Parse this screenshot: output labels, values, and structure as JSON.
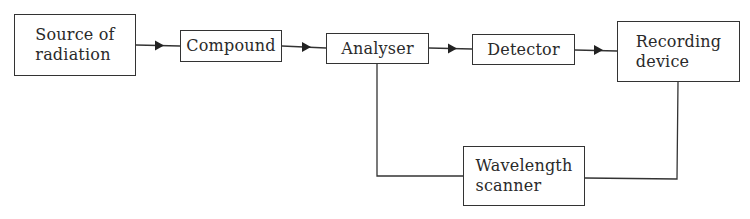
{
  "diagram": {
    "type": "block-flow",
    "nodes": [
      {
        "id": "source",
        "label": "Source of\nradiation"
      },
      {
        "id": "compound",
        "label": "Compound"
      },
      {
        "id": "analyser",
        "label": "Analyser"
      },
      {
        "id": "detector",
        "label": "Detector"
      },
      {
        "id": "recorder",
        "label": "Recording\ndevice"
      },
      {
        "id": "scanner",
        "label": "Wavelength\nscanner"
      }
    ],
    "edges": [
      {
        "from": "source",
        "to": "compound",
        "arrow": true
      },
      {
        "from": "compound",
        "to": "analyser",
        "arrow": true
      },
      {
        "from": "analyser",
        "to": "detector",
        "arrow": true
      },
      {
        "from": "detector",
        "to": "recorder",
        "arrow": true
      },
      {
        "from": "analyser",
        "to": "scanner",
        "arrow": false
      },
      {
        "from": "scanner",
        "to": "recorder",
        "arrow": false
      }
    ]
  }
}
